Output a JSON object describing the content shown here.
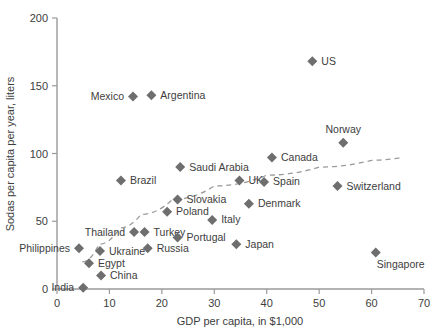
{
  "chart_data": {
    "type": "scatter",
    "title": "",
    "xlabel": "GDP per capita, in $1,000",
    "ylabel": "Sodas per capita per year, liters",
    "xlim": [
      0,
      70
    ],
    "ylim": [
      0,
      200
    ],
    "xticks": [
      0,
      10,
      20,
      30,
      40,
      50,
      60,
      70
    ],
    "yticks": [
      0,
      50,
      100,
      150,
      200
    ],
    "grid": false,
    "legend": "none",
    "trendline": {
      "style": "dashed",
      "description": "logarithmic fit rising left to right and flattening",
      "points": [
        {
          "x": 4.8,
          "y": 20
        },
        {
          "x": 8,
          "y": 33
        },
        {
          "x": 12,
          "y": 45
        },
        {
          "x": 16,
          "y": 55
        },
        {
          "x": 22,
          "y": 66
        },
        {
          "x": 30,
          "y": 76
        },
        {
          "x": 40,
          "y": 84
        },
        {
          "x": 50,
          "y": 90
        },
        {
          "x": 60,
          "y": 95
        },
        {
          "x": 65.5,
          "y": 97
        }
      ]
    },
    "points": [
      {
        "label": "US",
        "x": 48.7,
        "y": 168,
        "label_pos": "right"
      },
      {
        "label": "Mexico",
        "x": 14.5,
        "y": 142,
        "label_pos": "left"
      },
      {
        "label": "Argentina",
        "x": 18.0,
        "y": 143,
        "label_pos": "right"
      },
      {
        "label": "Norway",
        "x": 54.6,
        "y": 108,
        "label_pos": "above"
      },
      {
        "label": "Canada",
        "x": 41.0,
        "y": 97,
        "label_pos": "right"
      },
      {
        "label": "Saudi Arabia",
        "x": 23.5,
        "y": 90,
        "label_pos": "right"
      },
      {
        "label": "UK",
        "x": 34.8,
        "y": 80,
        "label_pos": "right"
      },
      {
        "label": "Spain",
        "x": 39.5,
        "y": 79,
        "label_pos": "right"
      },
      {
        "label": "Brazil",
        "x": 12.2,
        "y": 80,
        "label_pos": "right"
      },
      {
        "label": "Switzerland",
        "x": 53.5,
        "y": 76,
        "label_pos": "right"
      },
      {
        "label": "Slovakia",
        "x": 23.0,
        "y": 66,
        "label_pos": "right"
      },
      {
        "label": "Denmark",
        "x": 36.6,
        "y": 63,
        "label_pos": "right"
      },
      {
        "label": "Poland",
        "x": 21.0,
        "y": 57,
        "label_pos": "right"
      },
      {
        "label": "Italy",
        "x": 29.6,
        "y": 51,
        "label_pos": "right"
      },
      {
        "label": "Thailand",
        "x": 14.7,
        "y": 42,
        "label_pos": "left"
      },
      {
        "label": "Turkey",
        "x": 16.7,
        "y": 42,
        "label_pos": "right"
      },
      {
        "label": "Portugal",
        "x": 23.0,
        "y": 38,
        "label_pos": "right"
      },
      {
        "label": "Philippines",
        "x": 4.2,
        "y": 30,
        "label_pos": "left"
      },
      {
        "label": "Ukraine",
        "x": 8.2,
        "y": 28,
        "label_pos": "right"
      },
      {
        "label": "Russia",
        "x": 17.3,
        "y": 30,
        "label_pos": "right"
      },
      {
        "label": "Japan",
        "x": 34.2,
        "y": 33,
        "label_pos": "right"
      },
      {
        "label": "Singapore",
        "x": 60.8,
        "y": 27,
        "label_pos": "below-right"
      },
      {
        "label": "Egypt",
        "x": 6.1,
        "y": 19,
        "label_pos": "right"
      },
      {
        "label": "China",
        "x": 8.4,
        "y": 10,
        "label_pos": "right"
      },
      {
        "label": "India",
        "x": 5.0,
        "y": 1,
        "label_pos": "left"
      }
    ]
  }
}
